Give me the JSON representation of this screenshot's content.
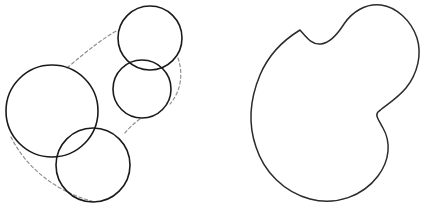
{
  "figure": {
    "canvas": {
      "width": 424,
      "height": 209,
      "background": "#ffffff"
    },
    "panels": [
      {
        "id": "left",
        "name": "disc-cover-panel",
        "caption": ""
      },
      {
        "id": "right",
        "name": "smooth-region-panel",
        "caption": ""
      }
    ],
    "colors": {
      "solid_outline": "#1a1a1a",
      "blob_outline": "#2b2b2b",
      "dashed_guide": "#8d8d8d",
      "background": "#ffffff"
    },
    "left_panel": {
      "name": "disc-arrangement",
      "circles": [
        {
          "id": "disc-large-left",
          "label": "large left disc",
          "cx": 52,
          "cy": 111,
          "r": 46
        },
        {
          "id": "disc-top-right",
          "label": "top right disc",
          "cx": 150,
          "cy": 38,
          "r": 32
        },
        {
          "id": "disc-middle",
          "label": "middle disc",
          "cx": 142,
          "cy": 89,
          "r": 29
        },
        {
          "id": "disc-bottom",
          "label": "bottom disc",
          "cx": 93,
          "cy": 165,
          "r": 37
        }
      ],
      "dashed_arcs": [
        {
          "id": "arc-top",
          "label": "upper connecting arc",
          "d": "M 67 68 C 88 50 102 39 118 30"
        },
        {
          "id": "arc-right",
          "label": "right connecting arc",
          "d": "M 178 58 C 184 76 180 92 170 104"
        },
        {
          "id": "arc-notch",
          "label": "notch connecting arc",
          "d": "M 140 119 C 133 124 128 129 124 134"
        },
        {
          "id": "arc-bottom",
          "label": "lower connecting arc",
          "d": "M 11 137 C 25 166 55 192 95 202"
        }
      ]
    },
    "right_panel": {
      "name": "smooth-blob",
      "shape_id": "blob-outline",
      "label": "smooth closed region",
      "d": "M 300 30 C 282 41 268 56 260 75 C 250 99 248 124 256 147 C 264 172 284 192 310 199 C 336 206 363 196 378 176 C 390 160 391 142 383 128 C 378 119 375 115 378 112 C 384 106 396 100 406 88 C 418 73 422 54 417 38 C 411 20 396 7 381 5 C 366 3 352 12 344 24 C 337 35 330 43 321 44 C 312 45 307 38 300 30 Z"
    }
  }
}
